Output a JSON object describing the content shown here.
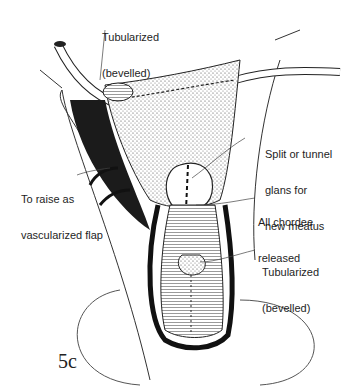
{
  "figure": {
    "number": "5c",
    "labels": {
      "tubularized_top": {
        "line1": "Tubularized",
        "line2": "(bevelled)"
      },
      "split_glans": {
        "line1": "Split or tunnel",
        "line2": "glans for",
        "line3": "new meatus"
      },
      "vascularized_flap": {
        "line1": "To raise as",
        "line2": "vascularized flap"
      },
      "chordee": {
        "line1": "All chordee",
        "line2": "released"
      },
      "tubularized_bottom": {
        "line1": "Tubularized",
        "line2": "(bevelled)"
      }
    },
    "colors": {
      "ink": "#1a1a1a",
      "background": "#ffffff"
    }
  }
}
